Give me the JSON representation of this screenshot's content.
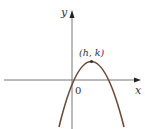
{
  "diagram": {
    "type": "parabola-graph",
    "axes": {
      "x_label": "x",
      "y_label": "y",
      "origin_label": "0"
    },
    "vertex": {
      "label": "(h, k)"
    },
    "colors": {
      "axis": "#555555",
      "curve": "#6b4a3a",
      "text": "#333333"
    }
  }
}
